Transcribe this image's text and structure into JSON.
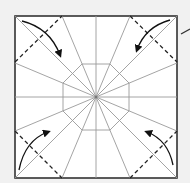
{
  "diagram": {
    "type": "origami-crease-pattern",
    "colors": {
      "background": "#f1f1f1",
      "paper": "#ffffff",
      "border": "#333333",
      "crease": "#9a9a9a",
      "fold_line": "#222222",
      "arrow": "#111111"
    },
    "corner_folds": [
      {
        "corner": "top-left",
        "arrow": "clockwise-inward"
      },
      {
        "corner": "top-right",
        "arrow": "counterclockwise-inward"
      },
      {
        "corner": "bottom-left",
        "arrow": "upward-inward"
      },
      {
        "corner": "bottom-right",
        "arrow": "upward-inward"
      }
    ],
    "annotation": "slash-mark-right"
  }
}
